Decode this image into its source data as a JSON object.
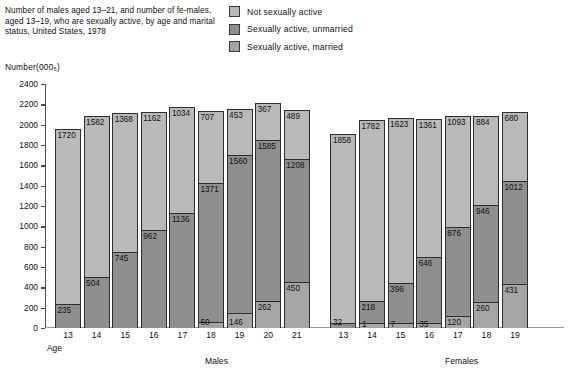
{
  "caption": "Number of males aged 13–21, and number of fe-males, aged 13–19, who are sexually active, by age and marital status, United States, 1978",
  "y_axis_title": "Number(000₅)",
  "legend": [
    {
      "label": "Not sexually active",
      "color": "#b9b9b9",
      "icon": "legend-swatch"
    },
    {
      "label": "Sexually active, unmarried",
      "color": "#8f8f8f",
      "icon": "legend-swatch"
    },
    {
      "label": "Sexually active, married",
      "color": "#a5a5a5",
      "icon": "legend-swatch"
    }
  ],
  "group_labels": {
    "males": "Males",
    "females": "Females",
    "age": "Age"
  },
  "chart_data": {
    "type": "bar",
    "subtype": "stacked",
    "xlabel": "Age",
    "ylabel": "Number(000₅)",
    "ylim": [
      0,
      2400
    ],
    "ytick_step": 200,
    "yticks": [
      0,
      200,
      400,
      600,
      800,
      1000,
      1200,
      1400,
      1600,
      1800,
      2000,
      2200,
      2400
    ],
    "grid": false,
    "legend_position": "top-center",
    "groups": [
      "Males",
      "Females"
    ],
    "categories": [
      {
        "group": "Males",
        "age": "13"
      },
      {
        "group": "Males",
        "age": "14"
      },
      {
        "group": "Males",
        "age": "15"
      },
      {
        "group": "Males",
        "age": "16"
      },
      {
        "group": "Males",
        "age": "17"
      },
      {
        "group": "Males",
        "age": "18"
      },
      {
        "group": "Males",
        "age": "19"
      },
      {
        "group": "Males",
        "age": "20"
      },
      {
        "group": "Males",
        "age": "21"
      },
      {
        "group": "Females",
        "age": "13"
      },
      {
        "group": "Females",
        "age": "14"
      },
      {
        "group": "Females",
        "age": "15"
      },
      {
        "group": "Females",
        "age": "16"
      },
      {
        "group": "Females",
        "age": "17"
      },
      {
        "group": "Females",
        "age": "18"
      },
      {
        "group": "Females",
        "age": "19"
      }
    ],
    "series": [
      {
        "name": "Not sexually active",
        "color": "#b9b9b9",
        "values": [
          1720,
          1582,
          1368,
          1162,
          1034,
          707,
          453,
          367,
          489,
          1858,
          1782,
          1623,
          1361,
          1093,
          884,
          680
        ]
      },
      {
        "name": "Sexually active, unmarried",
        "color": "#8f8f8f",
        "values": [
          235,
          504,
          745,
          962,
          1136,
          1371,
          1560,
          1585,
          1208,
          32,
          218,
          396,
          646,
          876,
          946,
          1012
        ]
      },
      {
        "name": "Sexually active, married",
        "color": "#a5a5a5",
        "values": [
          0,
          0,
          0,
          0,
          0,
          60,
          146,
          262,
          450,
          0,
          1,
          7,
          35,
          120,
          260,
          431
        ]
      }
    ]
  },
  "bars": [
    {
      "age": "13",
      "group": "males",
      "not_active": "1720",
      "unmarried": "235",
      "married": ""
    },
    {
      "age": "14",
      "group": "males",
      "not_active": "1582",
      "unmarried": "504",
      "married": ""
    },
    {
      "age": "15",
      "group": "males",
      "not_active": "1368",
      "unmarried": "745",
      "married": ""
    },
    {
      "age": "16",
      "group": "males",
      "not_active": "1162",
      "unmarried": "962",
      "married": ""
    },
    {
      "age": "17",
      "group": "males",
      "not_active": "1034",
      "unmarried": "1136",
      "married": ""
    },
    {
      "age": "18",
      "group": "males",
      "not_active": "707",
      "unmarried": "1371",
      "married": "60"
    },
    {
      "age": "19",
      "group": "males",
      "not_active": "453",
      "unmarried": "1560",
      "married": "146"
    },
    {
      "age": "20",
      "group": "males",
      "not_active": "367",
      "unmarried": "1585",
      "married": "262"
    },
    {
      "age": "21",
      "group": "males",
      "not_active": "489",
      "unmarried": "1208",
      "married": "450"
    },
    {
      "age": "13",
      "group": "females",
      "not_active": "1858",
      "unmarried": "32",
      "married": ""
    },
    {
      "age": "14",
      "group": "females",
      "not_active": "1782",
      "unmarried": "218",
      "married": "1"
    },
    {
      "age": "15",
      "group": "females",
      "not_active": "1623",
      "unmarried": "396",
      "married": "7"
    },
    {
      "age": "16",
      "group": "females",
      "not_active": "1361",
      "unmarried": "646",
      "married": "35"
    },
    {
      "age": "17",
      "group": "females",
      "not_active": "1093",
      "unmarried": "876",
      "married": "120"
    },
    {
      "age": "18",
      "group": "females",
      "not_active": "884",
      "unmarried": "946",
      "married": "260"
    },
    {
      "age": "19",
      "group": "females",
      "not_active": "680",
      "unmarried": "1012",
      "married": "431"
    }
  ]
}
